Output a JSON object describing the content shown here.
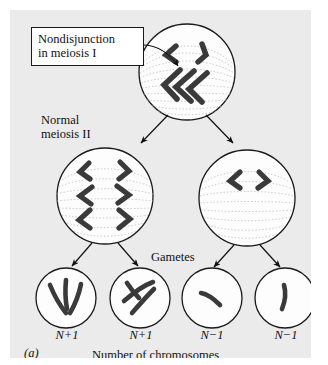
{
  "figure": {
    "panel_letter": "(a)",
    "caption_bottom": "Number of chromosomes",
    "background_color": "#ebebeb",
    "page_color": "#ffffff",
    "ink_color": "#111111",
    "chromosome_color": "#3a3a3a",
    "spindle_color": "#b8b8b8"
  },
  "callout": {
    "text": "Nondisjunction in meiosis I",
    "line1": "Nondisjunction",
    "line2": "in meiosis I"
  },
  "labels": {
    "normal_meiosis": "Normal meiosis II",
    "normal_meiosis_line1": "Normal",
    "normal_meiosis_line2": "meiosis II",
    "gametes": "Gametes"
  },
  "cells": {
    "parent": {
      "name": "meiosis-I-cell",
      "chromosome_count": 5,
      "note": "nondisjunction: 3 chromosomes cluster at one pole, 2 at the other"
    },
    "meiosis_ii": [
      {
        "name": "meiosis-II-cell-left",
        "chromosome_count": 6
      },
      {
        "name": "meiosis-II-cell-right",
        "chromosome_count": 2
      }
    ],
    "gametes": [
      {
        "name": "gamete-1",
        "ploidy": "N+1",
        "chromosome_count": 3
      },
      {
        "name": "gamete-2",
        "ploidy": "N+1",
        "chromosome_count": 3
      },
      {
        "name": "gamete-3",
        "ploidy": "N-1",
        "chromosome_count": 1
      },
      {
        "name": "gamete-4",
        "ploidy": "N-1",
        "chromosome_count": 1
      }
    ]
  },
  "ploidy_labels": [
    "N+1",
    "N+1",
    "N−1",
    "N−1"
  ]
}
